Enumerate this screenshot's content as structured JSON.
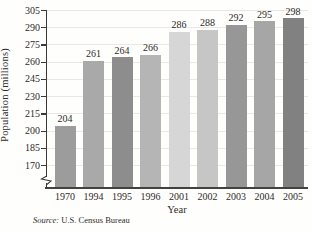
{
  "chart_data": {
    "type": "bar",
    "title": "",
    "xlabel": "Year",
    "ylabel": "Population (millions)",
    "categories": [
      "1970",
      "1994",
      "1995",
      "1996",
      "2001",
      "2002",
      "2003",
      "2004",
      "2005"
    ],
    "values": [
      204,
      261,
      264,
      266,
      286,
      288,
      292,
      295,
      298
    ],
    "bar_colors": [
      "#9c9c9c",
      "#a9a9a9",
      "#8d8d8d",
      "#b5b5b5",
      "#d6d6d6",
      "#c6c6c6",
      "#979797",
      "#a6a6a6",
      "#818181"
    ],
    "yticks": [
      170,
      185,
      200,
      215,
      230,
      245,
      260,
      275,
      290,
      305
    ],
    "ylim": [
      170,
      305
    ],
    "grid": true,
    "axis_break": true,
    "legend": "none"
  },
  "source": {
    "prefix": "Source:",
    "text": " U.S. Census Bureau"
  },
  "colors": {
    "axis": "#3c3936",
    "grid": "#ece7e3",
    "text": "#2e2b29"
  }
}
